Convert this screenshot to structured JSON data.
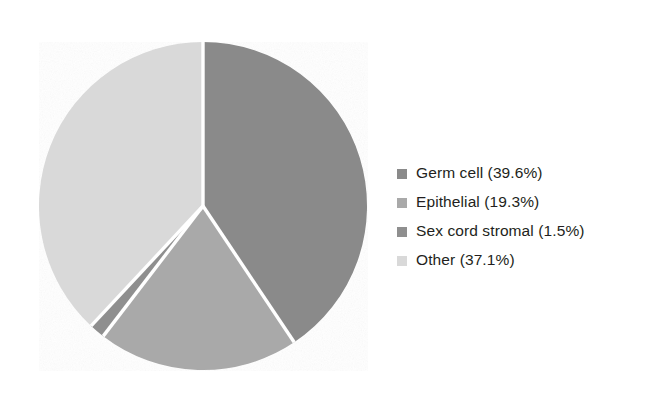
{
  "chart_data": {
    "type": "pie",
    "title": "",
    "subtitle": "",
    "xlabel": "",
    "ylabel": "",
    "grid": false,
    "legend_position": "right",
    "start_angle_deg": 0,
    "direction": "clockwise",
    "categories": [
      "Germ cell",
      "Epithelial",
      "Sex cord stromal",
      "Other"
    ],
    "values": [
      39.6,
      19.3,
      1.5,
      37.1
    ],
    "value_unit": "%",
    "colors": [
      "#8a8a8a",
      "#a9a9a9",
      "#8f8f8f",
      "#d9d9d9"
    ],
    "separator_color": "#ffffff",
    "slices": [
      {
        "label": "Germ cell",
        "value": 39.6,
        "display": "39.6%",
        "color": "#8a8a8a"
      },
      {
        "label": "Epithelial",
        "value": 19.3,
        "display": "19.3%",
        "color": "#a9a9a9"
      },
      {
        "label": "Sex cord stromal",
        "value": 1.5,
        "display": "1.5%",
        "color": "#8f8f8f"
      },
      {
        "label": "Other",
        "value": 37.1,
        "display": "37.1%",
        "color": "#d9d9d9"
      }
    ],
    "legend_entries": [
      {
        "text": "Germ cell (39.6%)",
        "swatch": "#8a8a8a"
      },
      {
        "text": "Epithelial (19.3%)",
        "swatch": "#a9a9a9"
      },
      {
        "text": "Sex cord stromal (1.5%)",
        "swatch": "#8f8f8f"
      },
      {
        "text": "Other (37.1%)",
        "swatch": "#d9d9d9"
      }
    ]
  },
  "legend": {
    "items": [
      {
        "label": "Germ cell (39.6%)"
      },
      {
        "label": "Epithelial (19.3%)"
      },
      {
        "label": "Sex cord stromal (1.5%)"
      },
      {
        "label": "Other (37.1%)"
      }
    ]
  }
}
